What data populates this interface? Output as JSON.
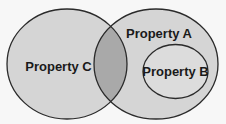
{
  "diagram": {
    "type": "venn",
    "background": "#f7f7f7",
    "stroke_color": "#2a2a2a",
    "sets": [
      {
        "id": "C",
        "label": "Property C",
        "fill": "#d5d5d5",
        "relation": "overlaps Property A"
      },
      {
        "id": "A",
        "label": "Property A",
        "fill": "#d5d5d5",
        "relation": "overlaps Property C"
      },
      {
        "id": "B",
        "label": "Property B",
        "fill": "#dcdcdc",
        "relation": "subset of Property A"
      }
    ],
    "overlap_fill": "#a9a9a9"
  }
}
